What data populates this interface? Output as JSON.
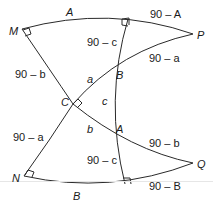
{
  "diagram": {
    "points": {
      "M": "M",
      "P": "P",
      "C": "C",
      "B": "B",
      "A": "A",
      "N": "N",
      "Q": "Q"
    },
    "labels": {
      "top_arc": "A",
      "top_right_arc": "90 – A",
      "upper_vertical": "90 – c",
      "left_upper": "90 – b",
      "upper_right_diag": "90 – a",
      "side_a": "a",
      "side_c": "c",
      "side_b": "b",
      "lower_right_diag": "90 – b",
      "left_lower": "90 – a",
      "lower_vertical": "90 – c",
      "bottom_right_arc": "90 – B",
      "bottom_arc": "B"
    },
    "right_angle_marks": [
      "M",
      "top-foot",
      "C",
      "N",
      "bottom-foot"
    ],
    "colors": {
      "stroke": "#2a2a2a",
      "text": "#1a1a1a",
      "background": "#ffffff"
    }
  }
}
